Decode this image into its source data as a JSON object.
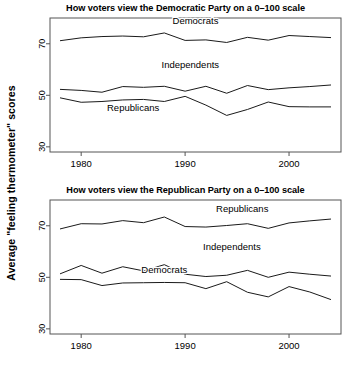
{
  "figure": {
    "ylabel": "Average \"feeling thermometer\" scores",
    "background_color": "#ffffff",
    "line_color": "#1a1a1a",
    "axis_color": "#555555",
    "text_color": "#000000"
  },
  "panels": [
    {
      "id": "democratic-party-panel",
      "title": "How voters view the Democratic Party on a 0–100 scale",
      "series_labels": [
        {
          "name": "Democrats",
          "x": 1991.0,
          "y": 77.5
        },
        {
          "name": "Independents",
          "x": 1990.5,
          "y": 60.5
        },
        {
          "name": "Republicans",
          "x": 1985.0,
          "y": 44.0
        }
      ]
    },
    {
      "id": "republican-party-panel",
      "title": "How voters view the Republican Party on a 0–100 scale",
      "series_labels": [
        {
          "name": "Republicans",
          "x": 1995.5,
          "y": 75.5
        },
        {
          "name": "Independents",
          "x": 1994.5,
          "y": 60.5
        },
        {
          "name": "Democrats",
          "x": 1988.0,
          "y": 51.5
        }
      ]
    }
  ],
  "chart_data": [
    {
      "type": "line",
      "title": "How voters view the Democratic Party on a 0–100 scale",
      "xlabel": "",
      "ylabel": "Average \"feeling thermometer\" scores",
      "x": [
        1978,
        1980,
        1982,
        1984,
        1986,
        1988,
        1990,
        1992,
        1994,
        1996,
        1998,
        2000,
        2002,
        2004
      ],
      "xlim": [
        1977,
        2005
      ],
      "ylim": [
        28,
        80
      ],
      "xticks": [
        1980,
        1990,
        2000
      ],
      "xticklabels": [
        "1980",
        "1990",
        "2000"
      ],
      "yticks": [
        30,
        50,
        70
      ],
      "yticklabels": [
        "30",
        "50",
        "70"
      ],
      "grid": false,
      "legend": "inline-labels",
      "series": [
        {
          "name": "Democrats",
          "values": [
            71.2,
            72.3,
            72.8,
            73.0,
            72.7,
            74.2,
            71.3,
            71.5,
            70.5,
            72.5,
            71.4,
            73.2,
            72.8,
            72.4
          ]
        },
        {
          "name": "Independents",
          "values": [
            52.3,
            51.9,
            51.2,
            53.4,
            53.1,
            53.5,
            51.6,
            53.5,
            50.8,
            53.8,
            52.2,
            52.9,
            53.4,
            54.0
          ]
        },
        {
          "name": "Republicans",
          "values": [
            49.0,
            47.3,
            47.6,
            48.2,
            48.4,
            47.6,
            49.6,
            46.2,
            42.2,
            44.5,
            47.4,
            45.6,
            45.5,
            45.5
          ]
        }
      ]
    },
    {
      "type": "line",
      "title": "How voters view the Republican Party on a 0–100 scale",
      "xlabel": "",
      "ylabel": "Average \"feeling thermometer\" scores",
      "x": [
        1978,
        1980,
        1982,
        1984,
        1986,
        1988,
        1990,
        1992,
        1994,
        1996,
        1998,
        2000,
        2002,
        2004
      ],
      "xlim": [
        1977,
        2005
      ],
      "ylim": [
        28,
        80
      ],
      "xticks": [
        1980,
        1990,
        2000
      ],
      "xticklabels": [
        "1980",
        "1990",
        "2000"
      ],
      "yticks": [
        30,
        50,
        70
      ],
      "yticklabels": [
        "30",
        "50",
        "70"
      ],
      "grid": false,
      "legend": "inline-labels",
      "series": [
        {
          "name": "Republicans",
          "values": [
            68.8,
            70.8,
            70.7,
            72.0,
            71.2,
            73.4,
            69.7,
            69.5,
            70.1,
            70.8,
            69.0,
            71.1,
            71.9,
            72.6
          ]
        },
        {
          "name": "Independents",
          "values": [
            51.4,
            54.6,
            51.6,
            54.1,
            52.5,
            54.9,
            51.2,
            50.3,
            50.8,
            52.7,
            50.0,
            52.0,
            51.2,
            50.5
          ]
        },
        {
          "name": "Democrats",
          "values": [
            49.2,
            49.1,
            46.8,
            47.8,
            47.9,
            48.0,
            47.9,
            45.6,
            48.3,
            44.2,
            42.4,
            46.4,
            44.3,
            41.4
          ]
        }
      ]
    }
  ]
}
